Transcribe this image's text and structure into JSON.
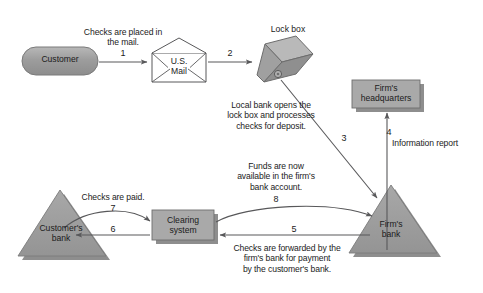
{
  "diagram": {
    "nodes": {
      "customer": {
        "label": "Customer",
        "shape": "capsule"
      },
      "us_mail": {
        "label": "U.S.\nMail",
        "shape": "envelope"
      },
      "lock_box": {
        "label": "Lock box",
        "shape": "box3d"
      },
      "firms_headquarters": {
        "label": "Firm's\nheadquarters",
        "shape": "rect"
      },
      "firms_bank": {
        "label": "Firm's\nbank",
        "shape": "triangle"
      },
      "clearing_system": {
        "label": "Clearing\nsystem",
        "shape": "rect"
      },
      "customers_bank": {
        "label": "Customer's\nbank",
        "shape": "triangle"
      }
    },
    "steps": [
      {
        "number": "1",
        "label": "Checks are placed in\nthe mail.",
        "from": "customer",
        "to": "us_mail"
      },
      {
        "number": "2",
        "label": "",
        "from": "us_mail",
        "to": "lock_box"
      },
      {
        "number": "3",
        "label": "Local bank opens the\nlock box and processes\nchecks for deposit.",
        "from": "lock_box",
        "to": "firms_bank"
      },
      {
        "number": "4",
        "label": "Information report",
        "from": "firms_bank",
        "to": "firms_headquarters"
      },
      {
        "number": "5",
        "label": "Checks are forwarded by the\nfirm's bank for payment\nby the customer's bank.",
        "from": "firms_bank",
        "to": "clearing_system"
      },
      {
        "number": "6",
        "label": "",
        "from": "clearing_system",
        "to": "customers_bank"
      },
      {
        "number": "7",
        "label": "Checks are paid.",
        "from": "customers_bank",
        "to": "clearing_system"
      },
      {
        "number": "8",
        "label": "Funds are now\navailable in the firm's\nbank account.",
        "from": "clearing_system",
        "to": "firms_bank"
      }
    ],
    "colors": {
      "shape_fill": "#9a9a9a",
      "shape_fill_light": "#b3b3b3",
      "shape_stroke": "#6d6d6d",
      "line": "#58585a",
      "text": "#1b1b1b",
      "background": "#ffffff"
    }
  }
}
